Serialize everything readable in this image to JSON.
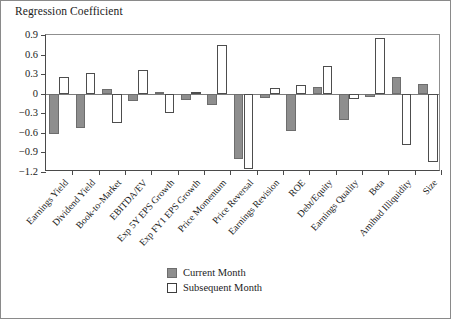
{
  "chart_data": {
    "type": "bar",
    "title": "Regression Coefficient",
    "xlabel": "",
    "ylabel": "Regression Coefficient",
    "ylim": [
      -1.2,
      0.9
    ],
    "yticks": [
      0.9,
      0.6,
      0.3,
      0,
      -0.3,
      -0.6,
      -0.9,
      -1.2
    ],
    "ytick_labels": [
      "0.9",
      "0.6",
      "0.3",
      "0",
      "−0.3",
      "−0.6",
      "−0.9",
      "−1.2"
    ],
    "grid": false,
    "legend_position": "bottom-center",
    "categories": [
      "Earnings Yield",
      "Dividend Yield",
      "Book-to-Market",
      "EBITDA/EV",
      "Exp 5Y EPS Growth",
      "Exp FY1 EPS Growth",
      "Price Momentum",
      "Price Reversal",
      "Earnings Revision",
      "ROE",
      "Debt/Equity",
      "Earnings Quality",
      "Beta",
      "Amihud Illiquidity",
      "Size"
    ],
    "series": [
      {
        "name": "Current Month",
        "color": "#8e8e8e",
        "values": [
          -0.62,
          -0.52,
          0.07,
          -0.11,
          0.02,
          -0.09,
          -0.17,
          -1.0,
          -0.07,
          -0.57,
          0.1,
          -0.4,
          -0.05,
          0.25,
          0.15
        ]
      },
      {
        "name": "Subsequent Month",
        "color": "#ffffff",
        "values": [
          0.26,
          0.32,
          -0.45,
          0.37,
          -0.29,
          0.03,
          0.74,
          -1.15,
          0.09,
          0.13,
          0.43,
          -0.08,
          0.86,
          -0.78,
          -1.05
        ]
      }
    ]
  },
  "legend": {
    "items": [
      {
        "label": "Current Month"
      },
      {
        "label": "Subsequent Month"
      }
    ]
  },
  "colors": {
    "current_month": "#8e8e8e",
    "subsequent_month": "#ffffff",
    "axis": "#4a4a4a",
    "frame": "#8a8a8a"
  }
}
